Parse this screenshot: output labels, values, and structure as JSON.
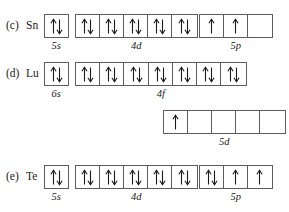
{
  "figure": {
    "kind": "orbital-box-diagram",
    "line_color": "#5d5d5d",
    "arrow_color": "#1a1a1a",
    "text_color": "#1a1a1a"
  },
  "rows": [
    {
      "part": "(c)",
      "element": "Sn",
      "groups": [
        {
          "sublabel": "5s",
          "boxes": [
            "updown"
          ]
        },
        {
          "sublabel": "4d",
          "boxes": [
            "updown",
            "updown",
            "updown",
            "updown",
            "updown"
          ]
        },
        {
          "sublabel": "5p",
          "boxes": [
            "up",
            "up",
            "empty"
          ]
        }
      ]
    },
    {
      "part": "(d)",
      "element": "Lu",
      "groups": [
        {
          "sublabel": "6s",
          "boxes": [
            "updown"
          ]
        },
        {
          "sublabel": "4f",
          "boxes": [
            "updown",
            "updown",
            "updown",
            "updown",
            "updown",
            "updown",
            "updown"
          ]
        },
        {
          "sublabel": "5d",
          "boxes": [
            "up",
            "empty",
            "empty",
            "empty",
            "empty"
          ]
        }
      ]
    },
    {
      "part": "(e)",
      "element": "Te",
      "groups": [
        {
          "sublabel": "5s",
          "boxes": [
            "updown"
          ]
        },
        {
          "sublabel": "4d",
          "boxes": [
            "updown",
            "updown",
            "updown",
            "updown",
            "updown"
          ]
        },
        {
          "sublabel": "5p",
          "boxes": [
            "updown",
            "up",
            "up"
          ]
        }
      ]
    }
  ]
}
